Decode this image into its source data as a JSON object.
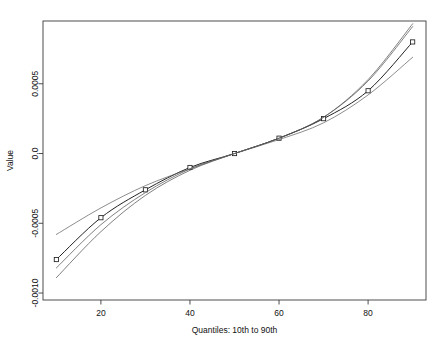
{
  "chart_data": {
    "type": "line",
    "title": "",
    "xlabel": "Quantiles: 10th to 90th",
    "ylabel": "Value",
    "x": [
      10,
      20,
      30,
      40,
      50,
      60,
      70,
      80,
      90
    ],
    "xlim": [
      7,
      93
    ],
    "ylim": [
      -0.00105,
      0.00095
    ],
    "xticks": [
      20,
      40,
      60,
      80
    ],
    "xticklabels": [
      "20",
      "40",
      "60",
      "80"
    ],
    "yticks": [
      0.0005,
      0.0,
      -0.0005,
      -0.001
    ],
    "yticklabels": [
      "0.0005",
      "0.0",
      "-0.0005",
      "-0.0010"
    ],
    "grid": false,
    "legend": false,
    "marker": "square",
    "series": [
      {
        "name": "estimate",
        "markers": true,
        "values": [
          -0.00076,
          -0.00046,
          -0.00026,
          -0.0001,
          0.0,
          0.00011,
          0.00025,
          0.00045,
          0.0008
        ]
      },
      {
        "name": "band-upper",
        "markers": false,
        "values": [
          -0.00082,
          -0.00051,
          -0.00028,
          -0.00011,
          0.0,
          0.00011,
          0.00026,
          0.00053,
          0.00093
        ]
      },
      {
        "name": "band-lower",
        "markers": false,
        "values": [
          -0.00089,
          -0.00056,
          -0.0003,
          -0.00012,
          0.0,
          0.00011,
          0.00026,
          0.00052,
          0.00091
        ]
      },
      {
        "name": "ols-reference",
        "markers": false,
        "values": [
          -0.00058,
          -0.00039,
          -0.00023,
          -0.00011,
          0.0,
          0.0001,
          0.00022,
          0.00042,
          0.00069
        ]
      }
    ],
    "colors": {
      "estimate": "#222222",
      "band-upper": "#555555",
      "band-lower": "#555555",
      "ols-reference": "#666666",
      "axis": "#3a3a3a",
      "background": "#ffffff"
    }
  }
}
